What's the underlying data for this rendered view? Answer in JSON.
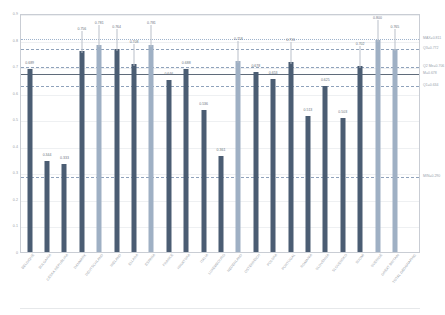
{
  "chart_data": {
    "type": "bar",
    "title": "",
    "xlabel": "",
    "ylabel": "",
    "ylim": [
      0,
      0.9
    ],
    "grid": true,
    "legend_position": "none",
    "y_ticks": [
      "0.9",
      "0.8",
      "0.7",
      "0.6",
      "0.5",
      "0.4",
      "0.3",
      "0.2",
      "0.1",
      "0"
    ],
    "y_tick_values": [
      0.9,
      0.8,
      0.7,
      0.6,
      0.5,
      0.4,
      0.3,
      0.2,
      0.1,
      0
    ],
    "categories": [
      "BELGIQUE",
      "BULGARIA",
      "CESKA REPUBLIKA",
      "DANMARK",
      "DEUTSCHLAND",
      "IRELAND",
      "ELLADA",
      "ESPANA",
      "FRANCE",
      "HRVATSKA",
      "ITALIA",
      "LUXEMBOURG",
      "NEDERLAND",
      "OSTERREICH",
      "POLSKA",
      "PORTUGAL",
      "ROMANIA",
      "SLOVENIJA",
      "SLOVENSKO",
      "SUOMI",
      "SVERIGE",
      "GREAT BRITAIN",
      "TOTAL GEOGRAPHIC"
    ],
    "values": [
      0.689,
      0.344,
      0.333,
      0.756,
      0.781,
      0.764,
      0.708,
      0.781,
      0.646,
      0.688,
      0.536,
      0.361,
      0.718,
      0.678,
      0.653,
      0.716,
      0.513,
      0.625,
      0.503,
      0.702,
      0.8,
      0.765,
      null
    ],
    "value_labels": [
      "0.689",
      "0.344",
      "0.333",
      "0.756",
      "0.781",
      "0.764",
      "0.708",
      "0.781",
      "0.646",
      "0.688",
      "0.536",
      "0.361",
      "0.718",
      "0.678",
      "0.653",
      "0.716",
      "0.513",
      "0.625",
      "0.503",
      "0.702",
      "0.800",
      "0.765",
      ""
    ],
    "bar_styles": [
      "primary",
      "primary",
      "primary",
      "primary",
      "alt",
      "primary",
      "primary",
      "alt",
      "primary",
      "primary",
      "primary",
      "primary",
      "alt",
      "primary",
      "primary",
      "primary",
      "primary",
      "primary",
      "primary",
      "primary",
      "alt",
      "alt",
      "none"
    ],
    "colors": {
      "bar_primary": "#4b5d73",
      "bar_alt": "#9fb0c4",
      "mean_line": "#5f6b7a",
      "quartile_line": "#8fa2bb",
      "max_line": "#9fb3cc",
      "gridline": "#eef0f2",
      "axis_text": "#9aa0a8",
      "plot_border": "#c9cdd4"
    },
    "reference_lines": [
      {
        "name": "max",
        "label": "MAX=0.811",
        "value": 0.811,
        "style": "dotted"
      },
      {
        "name": "q3",
        "label": "Q3=0.772",
        "value": 0.772,
        "style": "dashed"
      },
      {
        "name": "q2_med",
        "label": "Q2 Me=0.706",
        "value": 0.706,
        "style": "dashed"
      },
      {
        "name": "mean",
        "label": "M=0.678",
        "value": 0.678,
        "style": "solid"
      },
      {
        "name": "q1",
        "label": "Q1=0.634",
        "value": 0.634,
        "style": "dashed"
      },
      {
        "name": "min",
        "label": "MIN=0.290",
        "value": 0.29,
        "style": "dashed"
      }
    ]
  }
}
